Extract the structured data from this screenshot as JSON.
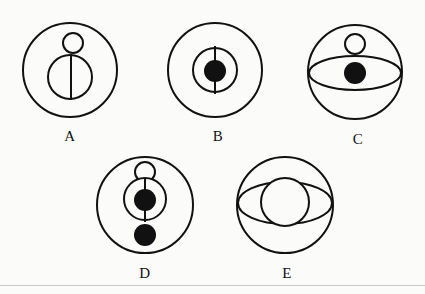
{
  "figure": {
    "background_color": "#fbfbfa",
    "stroke_color": "#111111",
    "fill_color": "#111111",
    "stroke_width": 2,
    "bottom_rule_color": "#c9c9c9",
    "bottom_rule_y": 285,
    "items": [
      {
        "id": "A",
        "label": "A",
        "label_x": 70,
        "label_y": 128,
        "outer": {
          "cx": 70,
          "cy": 70,
          "r": 47
        },
        "shapes": [
          {
            "kind": "circle-open",
            "cx": 73,
            "cy": 43,
            "r": 10
          },
          {
            "kind": "circle-open",
            "cx": 70,
            "cy": 77,
            "r": 22
          },
          {
            "kind": "line-vertical",
            "x": 71,
            "y1": 54,
            "y2": 100
          }
        ]
      },
      {
        "id": "B",
        "label": "B",
        "label_x": 218,
        "label_y": 128,
        "outer": {
          "cx": 215,
          "cy": 70,
          "r": 47
        },
        "shapes": [
          {
            "kind": "circle-open",
            "cx": 215,
            "cy": 70,
            "r": 22
          },
          {
            "kind": "line-vertical",
            "x": 215,
            "y1": 46,
            "y2": 94
          },
          {
            "kind": "circle-filled",
            "cx": 215,
            "cy": 71,
            "r": 11
          }
        ]
      },
      {
        "id": "C",
        "label": "C",
        "label_x": 358,
        "label_y": 131,
        "outer": {
          "cx": 355,
          "cy": 72,
          "r": 47
        },
        "shapes": [
          {
            "kind": "circle-open",
            "cx": 355,
            "cy": 44,
            "r": 10
          },
          {
            "kind": "ellipse-open",
            "cx": 355,
            "cy": 73,
            "rx": 46,
            "ry": 17
          },
          {
            "kind": "circle-filled",
            "cx": 355,
            "cy": 73,
            "r": 11
          }
        ]
      },
      {
        "id": "D",
        "label": "D",
        "label_x": 145,
        "label_y": 265,
        "outer": {
          "cx": 145,
          "cy": 205,
          "r": 48
        },
        "shapes": [
          {
            "kind": "circle-open",
            "cx": 145,
            "cy": 172,
            "r": 10
          },
          {
            "kind": "circle-open",
            "cx": 145,
            "cy": 199,
            "r": 21
          },
          {
            "kind": "line-vertical",
            "x": 145,
            "y1": 178,
            "y2": 222
          },
          {
            "kind": "circle-filled",
            "cx": 145,
            "cy": 200,
            "r": 11
          },
          {
            "kind": "circle-filled",
            "cx": 145,
            "cy": 235,
            "r": 11
          }
        ]
      },
      {
        "id": "E",
        "label": "E",
        "label_x": 287,
        "label_y": 265,
        "outer": {
          "cx": 285,
          "cy": 205,
          "r": 48
        },
        "shapes": [
          {
            "kind": "ellipse-open",
            "cx": 285,
            "cy": 203,
            "rx": 47,
            "ry": 21
          },
          {
            "kind": "circle-open",
            "cx": 285,
            "cy": 202,
            "r": 24
          }
        ]
      }
    ]
  }
}
